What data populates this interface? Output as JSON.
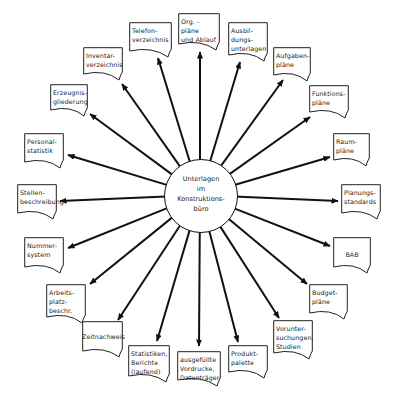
{
  "diagram": {
    "center": {
      "label": "Unterlagen\nim\nKonstruktions-\nbüro",
      "cx": 200,
      "cy": 195,
      "r": 36
    },
    "line_color": "#111111",
    "documents": [
      {
        "id": "org",
        "label": "Org. -\npläne\nund Ablauf",
        "x": 178,
        "y": 13,
        "w": 42,
        "h": 36,
        "ax": 200,
        "ay": 52
      },
      {
        "id": "telefon",
        "label": "Telefon-\nverzeichnis",
        "x": 129,
        "y": 22,
        "w": 43,
        "h": 34,
        "ax": 158,
        "ay": 58
      },
      {
        "id": "ausbildung",
        "label": "Ausbil-\ndungs-\nunterlagen",
        "x": 228,
        "y": 22,
        "w": 40,
        "h": 38,
        "ax": 240,
        "ay": 62
      },
      {
        "id": "inventar",
        "label": "Inventar-\nverzeichnis",
        "x": 83,
        "y": 47,
        "w": 40,
        "h": 32,
        "ax": 122,
        "ay": 84
      },
      {
        "id": "aufgaben",
        "label": "Aufgaben-\npläne",
        "x": 273,
        "y": 47,
        "w": 38,
        "h": 33,
        "ax": 283,
        "ay": 80
      },
      {
        "id": "erzeugnis",
        "label": "Erzeugnis-\ngliederung",
        "x": 50,
        "y": 84,
        "w": 38,
        "h": 31,
        "ax": 90,
        "ay": 114
      },
      {
        "id": "funktion",
        "label": "Funktions-\npläne",
        "x": 309,
        "y": 85,
        "w": 40,
        "h": 32,
        "ax": 310,
        "ay": 117
      },
      {
        "id": "personal",
        "label": "Personal-\nstatistik",
        "x": 24,
        "y": 133,
        "w": 40,
        "h": 34,
        "ax": 68,
        "ay": 155
      },
      {
        "id": "raum",
        "label": "Raum-\npläne",
        "x": 333,
        "y": 133,
        "w": 37,
        "h": 32,
        "ax": 330,
        "ay": 157
      },
      {
        "id": "stellen",
        "label": "Stellen-\nbeschreibung",
        "x": 17,
        "y": 184,
        "w": 40,
        "h": 34,
        "ax": 60,
        "ay": 201
      },
      {
        "id": "planung",
        "label": "Planungs-\nstandards",
        "x": 341,
        "y": 184,
        "w": 40,
        "h": 34,
        "ax": 338,
        "ay": 201
      },
      {
        "id": "nummer",
        "label": "Nummer-\nsystem",
        "x": 24,
        "y": 237,
        "w": 40,
        "h": 35,
        "ax": 68,
        "ay": 248
      },
      {
        "id": "bab",
        "label": "BAB",
        "x": 333,
        "y": 237,
        "w": 38,
        "h": 35,
        "ax": 330,
        "ay": 246
      },
      {
        "id": "arbeitsplatz",
        "label": "Arbeits-\nplatz-\nbeschr.",
        "x": 46,
        "y": 284,
        "w": 40,
        "h": 38,
        "ax": 90,
        "ay": 284
      },
      {
        "id": "budget",
        "label": "Budget-\npläne",
        "x": 309,
        "y": 284,
        "w": 39,
        "h": 34,
        "ax": 307,
        "ay": 284
      },
      {
        "id": "zeit",
        "label": "Zeitnachweis",
        "x": 82,
        "y": 321,
        "w": 41,
        "h": 35,
        "ax": 118,
        "ay": 320
      },
      {
        "id": "vorunter",
        "label": "Vorunter-\nsuchungen,\nStudien",
        "x": 273,
        "y": 320,
        "w": 40,
        "h": 38,
        "ax": 279,
        "ay": 318
      },
      {
        "id": "statistiken",
        "label": "Statistiken,\nBerichte\n(laufend)",
        "x": 128,
        "y": 345,
        "w": 42,
        "h": 36,
        "ax": 157,
        "ay": 341
      },
      {
        "id": "vordrucke",
        "label": "ausgefüllte\nVordrucke,\nDatenträger",
        "x": 177,
        "y": 351,
        "w": 44,
        "h": 34,
        "ax": 199,
        "ay": 346
      },
      {
        "id": "produkt",
        "label": "Produkt-\npalette",
        "x": 228,
        "y": 345,
        "w": 40,
        "h": 32,
        "ax": 238,
        "ay": 342
      }
    ]
  }
}
